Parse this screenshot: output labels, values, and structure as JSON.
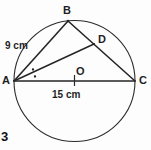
{
  "figure": {
    "number_label": "3",
    "type": "circle-geometry-diagram",
    "colors": {
      "stroke": "#262626",
      "circle_stroke": "#2b2b2b",
      "background": "#fdfdfd",
      "label_text": "#1f1f1f"
    },
    "points": {
      "A": {
        "label": "A",
        "x": 14,
        "y": 81
      },
      "B": {
        "label": "B",
        "x": 68,
        "y": 21
      },
      "C": {
        "label": "C",
        "x": 135,
        "y": 81
      },
      "D": {
        "label": "D",
        "x": 94,
        "y": 44
      },
      "O": {
        "label": "O",
        "x": 74.5,
        "y": 81
      }
    },
    "circle": {
      "center_x": 74.5,
      "center_y": 81,
      "radius": 60.5
    },
    "segments": [
      {
        "name": "AB",
        "from": "A",
        "to": "B"
      },
      {
        "name": "BC",
        "from": "B",
        "to": "C"
      },
      {
        "name": "AC",
        "from": "A",
        "to": "C"
      },
      {
        "name": "AD",
        "from": "A",
        "to": "D"
      }
    ],
    "measurements": {
      "ab_length": "9 cm",
      "ac_length": "15 cm"
    },
    "marks": {
      "angle_bisector_dots": 2,
      "tick_on_ac": 1
    }
  }
}
